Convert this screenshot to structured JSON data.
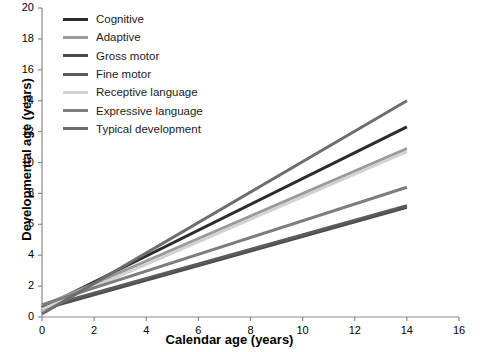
{
  "chart_data": {
    "type": "line",
    "title": "",
    "xlabel": "Calendar age (years)",
    "ylabel": "Developmental age (years)",
    "xlim": [
      0,
      16
    ],
    "ylim": [
      0,
      20
    ],
    "xticks": [
      0,
      2,
      4,
      6,
      8,
      10,
      12,
      14,
      16
    ],
    "yticks": [
      0,
      2,
      4,
      6,
      8,
      10,
      12,
      14,
      16,
      18,
      20
    ],
    "grid": false,
    "legend_position": "top-left",
    "series": [
      {
        "name": "Cognitive",
        "color": "#2b2b2b",
        "x": [
          0,
          14
        ],
        "values": [
          0.6,
          12.3
        ]
      },
      {
        "name": "Adaptive",
        "color": "#9a9a9a",
        "x": [
          0,
          14
        ],
        "values": [
          0.7,
          10.9
        ]
      },
      {
        "name": "Gross motor",
        "color": "#4a4a4a",
        "x": [
          0,
          14
        ],
        "values": [
          0.5,
          7.1
        ]
      },
      {
        "name": "Fine motor",
        "color": "#5a5a5a",
        "x": [
          0,
          14
        ],
        "values": [
          0.6,
          7.2
        ]
      },
      {
        "name": "Receptive language",
        "color": "#d2d2d2",
        "x": [
          0,
          14
        ],
        "values": [
          0.5,
          10.7
        ]
      },
      {
        "name": "Expressive language",
        "color": "#7d7d7d",
        "x": [
          0,
          14
        ],
        "values": [
          0.8,
          8.4
        ]
      },
      {
        "name": "Typical development",
        "color": "#6e6e6e",
        "x": [
          0,
          14
        ],
        "values": [
          0.2,
          14.0
        ]
      }
    ]
  },
  "axis": {
    "x_tick_labels": [
      "0",
      "2",
      "4",
      "6",
      "8",
      "10",
      "12",
      "14",
      "16"
    ],
    "y_tick_labels": [
      "0",
      "2",
      "4",
      "6",
      "8",
      "10",
      "12",
      "14",
      "16",
      "18",
      "20"
    ],
    "x_axis_title": "Calendar age (years)",
    "y_axis_title": "Developmental age (years)"
  },
  "legend": {
    "items": [
      {
        "label": "Cognitive",
        "color": "#2b2b2b"
      },
      {
        "label": "Adaptive",
        "color": "#9a9a9a"
      },
      {
        "label": "Gross motor",
        "color": "#4a4a4a"
      },
      {
        "label": "Fine motor",
        "color": "#5a5a5a"
      },
      {
        "label": "Receptive language",
        "color": "#d2d2d2"
      },
      {
        "label": "Expressive language",
        "color": "#7d7d7d"
      },
      {
        "label": "Typical development",
        "color": "#6e6e6e"
      }
    ]
  }
}
